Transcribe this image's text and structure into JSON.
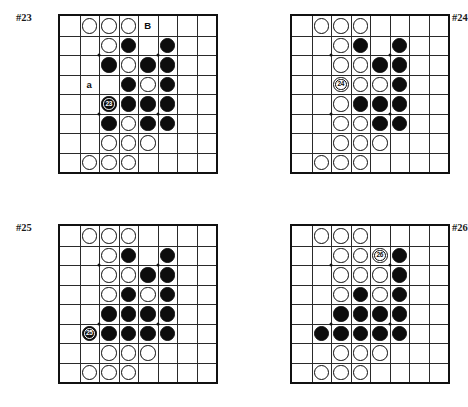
{
  "page": {
    "background_color": "#ffffff",
    "stone_colors": {
      "black": "#0d0d0d",
      "white": "#ffffff",
      "line": "#2a2a2a",
      "border": "#111111"
    }
  },
  "board_spec": {
    "columns": 8,
    "rows": 8,
    "hoshi_points": [
      [
        2,
        2
      ],
      [
        5,
        2
      ],
      [
        2,
        5
      ],
      [
        5,
        5
      ]
    ]
  },
  "diagrams": [
    {
      "id": "diagram-23",
      "label": "#23",
      "label_position": "left",
      "stones": [
        {
          "col": 1,
          "row": 0,
          "color": "white"
        },
        {
          "col": 2,
          "row": 0,
          "color": "white"
        },
        {
          "col": 3,
          "row": 0,
          "color": "white"
        },
        {
          "col": 2,
          "row": 1,
          "color": "white"
        },
        {
          "col": 3,
          "row": 1,
          "color": "black"
        },
        {
          "col": 5,
          "row": 1,
          "color": "black"
        },
        {
          "col": 2,
          "row": 2,
          "color": "black"
        },
        {
          "col": 3,
          "row": 2,
          "color": "white"
        },
        {
          "col": 4,
          "row": 2,
          "color": "black"
        },
        {
          "col": 5,
          "row": 2,
          "color": "black"
        },
        {
          "col": 3,
          "row": 3,
          "color": "black"
        },
        {
          "col": 4,
          "row": 3,
          "color": "white"
        },
        {
          "col": 5,
          "row": 3,
          "color": "black"
        },
        {
          "col": 2,
          "row": 4,
          "color": "black",
          "number": "23"
        },
        {
          "col": 3,
          "row": 4,
          "color": "black"
        },
        {
          "col": 4,
          "row": 4,
          "color": "black"
        },
        {
          "col": 5,
          "row": 4,
          "color": "black"
        },
        {
          "col": 2,
          "row": 5,
          "color": "black"
        },
        {
          "col": 3,
          "row": 5,
          "color": "white"
        },
        {
          "col": 4,
          "row": 5,
          "color": "black"
        },
        {
          "col": 5,
          "row": 5,
          "color": "black"
        },
        {
          "col": 2,
          "row": 6,
          "color": "white"
        },
        {
          "col": 3,
          "row": 6,
          "color": "white"
        },
        {
          "col": 4,
          "row": 6,
          "color": "white"
        },
        {
          "col": 1,
          "row": 7,
          "color": "white"
        },
        {
          "col": 2,
          "row": 7,
          "color": "white"
        },
        {
          "col": 3,
          "row": 7,
          "color": "white"
        }
      ],
      "labels": [
        {
          "col": 4,
          "row": 0,
          "text": "B"
        },
        {
          "col": 1,
          "row": 3,
          "text": "a"
        }
      ]
    },
    {
      "id": "diagram-24",
      "label": "#24",
      "label_position": "right",
      "stones": [
        {
          "col": 1,
          "row": 0,
          "color": "white"
        },
        {
          "col": 2,
          "row": 0,
          "color": "white"
        },
        {
          "col": 3,
          "row": 0,
          "color": "white"
        },
        {
          "col": 2,
          "row": 1,
          "color": "white"
        },
        {
          "col": 3,
          "row": 1,
          "color": "black"
        },
        {
          "col": 5,
          "row": 1,
          "color": "black"
        },
        {
          "col": 2,
          "row": 2,
          "color": "white"
        },
        {
          "col": 3,
          "row": 2,
          "color": "white"
        },
        {
          "col": 4,
          "row": 2,
          "color": "black"
        },
        {
          "col": 5,
          "row": 2,
          "color": "black"
        },
        {
          "col": 2,
          "row": 3,
          "color": "white",
          "number": "24"
        },
        {
          "col": 3,
          "row": 3,
          "color": "white"
        },
        {
          "col": 4,
          "row": 3,
          "color": "white"
        },
        {
          "col": 5,
          "row": 3,
          "color": "black"
        },
        {
          "col": 2,
          "row": 4,
          "color": "white"
        },
        {
          "col": 3,
          "row": 4,
          "color": "black"
        },
        {
          "col": 4,
          "row": 4,
          "color": "black"
        },
        {
          "col": 5,
          "row": 4,
          "color": "black"
        },
        {
          "col": 2,
          "row": 5,
          "color": "white"
        },
        {
          "col": 3,
          "row": 5,
          "color": "white"
        },
        {
          "col": 4,
          "row": 5,
          "color": "black"
        },
        {
          "col": 5,
          "row": 5,
          "color": "black"
        },
        {
          "col": 2,
          "row": 6,
          "color": "white"
        },
        {
          "col": 3,
          "row": 6,
          "color": "white"
        },
        {
          "col": 4,
          "row": 6,
          "color": "white"
        },
        {
          "col": 1,
          "row": 7,
          "color": "white"
        },
        {
          "col": 2,
          "row": 7,
          "color": "white"
        },
        {
          "col": 3,
          "row": 7,
          "color": "white"
        }
      ],
      "labels": []
    },
    {
      "id": "diagram-25",
      "label": "#25",
      "label_position": "left",
      "stones": [
        {
          "col": 1,
          "row": 0,
          "color": "white"
        },
        {
          "col": 2,
          "row": 0,
          "color": "white"
        },
        {
          "col": 3,
          "row": 0,
          "color": "white"
        },
        {
          "col": 2,
          "row": 1,
          "color": "white"
        },
        {
          "col": 3,
          "row": 1,
          "color": "black"
        },
        {
          "col": 5,
          "row": 1,
          "color": "black"
        },
        {
          "col": 2,
          "row": 2,
          "color": "white"
        },
        {
          "col": 3,
          "row": 2,
          "color": "white"
        },
        {
          "col": 4,
          "row": 2,
          "color": "black"
        },
        {
          "col": 5,
          "row": 2,
          "color": "black"
        },
        {
          "col": 2,
          "row": 3,
          "color": "white"
        },
        {
          "col": 3,
          "row": 3,
          "color": "black"
        },
        {
          "col": 4,
          "row": 3,
          "color": "white"
        },
        {
          "col": 5,
          "row": 3,
          "color": "black"
        },
        {
          "col": 2,
          "row": 4,
          "color": "black"
        },
        {
          "col": 3,
          "row": 4,
          "color": "black"
        },
        {
          "col": 4,
          "row": 4,
          "color": "black"
        },
        {
          "col": 5,
          "row": 4,
          "color": "black"
        },
        {
          "col": 1,
          "row": 5,
          "color": "black",
          "number": "25"
        },
        {
          "col": 2,
          "row": 5,
          "color": "black"
        },
        {
          "col": 3,
          "row": 5,
          "color": "black"
        },
        {
          "col": 4,
          "row": 5,
          "color": "black"
        },
        {
          "col": 5,
          "row": 5,
          "color": "black"
        },
        {
          "col": 2,
          "row": 6,
          "color": "white"
        },
        {
          "col": 3,
          "row": 6,
          "color": "white"
        },
        {
          "col": 4,
          "row": 6,
          "color": "white"
        },
        {
          "col": 1,
          "row": 7,
          "color": "white"
        },
        {
          "col": 2,
          "row": 7,
          "color": "white"
        },
        {
          "col": 3,
          "row": 7,
          "color": "white"
        }
      ],
      "labels": []
    },
    {
      "id": "diagram-26",
      "label": "#26",
      "label_position": "right",
      "stones": [
        {
          "col": 1,
          "row": 0,
          "color": "white"
        },
        {
          "col": 2,
          "row": 0,
          "color": "white"
        },
        {
          "col": 3,
          "row": 0,
          "color": "white"
        },
        {
          "col": 2,
          "row": 1,
          "color": "white"
        },
        {
          "col": 3,
          "row": 1,
          "color": "white"
        },
        {
          "col": 4,
          "row": 1,
          "color": "white",
          "number": "26"
        },
        {
          "col": 5,
          "row": 1,
          "color": "black"
        },
        {
          "col": 2,
          "row": 2,
          "color": "white"
        },
        {
          "col": 3,
          "row": 2,
          "color": "white"
        },
        {
          "col": 4,
          "row": 2,
          "color": "white"
        },
        {
          "col": 5,
          "row": 2,
          "color": "black"
        },
        {
          "col": 2,
          "row": 3,
          "color": "white"
        },
        {
          "col": 3,
          "row": 3,
          "color": "black"
        },
        {
          "col": 4,
          "row": 3,
          "color": "white"
        },
        {
          "col": 5,
          "row": 3,
          "color": "black"
        },
        {
          "col": 2,
          "row": 4,
          "color": "black"
        },
        {
          "col": 3,
          "row": 4,
          "color": "black"
        },
        {
          "col": 4,
          "row": 4,
          "color": "black"
        },
        {
          "col": 5,
          "row": 4,
          "color": "black"
        },
        {
          "col": 1,
          "row": 5,
          "color": "black"
        },
        {
          "col": 2,
          "row": 5,
          "color": "black"
        },
        {
          "col": 3,
          "row": 5,
          "color": "black"
        },
        {
          "col": 4,
          "row": 5,
          "color": "black"
        },
        {
          "col": 5,
          "row": 5,
          "color": "black"
        },
        {
          "col": 2,
          "row": 6,
          "color": "white"
        },
        {
          "col": 3,
          "row": 6,
          "color": "white"
        },
        {
          "col": 4,
          "row": 6,
          "color": "white"
        },
        {
          "col": 1,
          "row": 7,
          "color": "white"
        },
        {
          "col": 2,
          "row": 7,
          "color": "white"
        },
        {
          "col": 3,
          "row": 7,
          "color": "white"
        }
      ],
      "labels": []
    }
  ],
  "layout": {
    "diagram_origins": [
      {
        "x": 58,
        "y": 14
      },
      {
        "x": 290,
        "y": 14
      },
      {
        "x": 58,
        "y": 224
      },
      {
        "x": 290,
        "y": 224
      }
    ],
    "cell": 19.5,
    "label_offsets": {
      "left": -42,
      "right": 162,
      "y": -2
    }
  }
}
